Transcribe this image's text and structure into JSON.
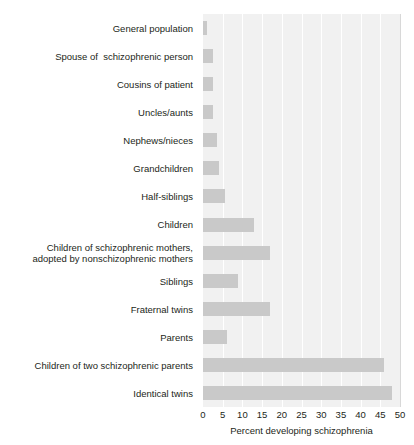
{
  "chart_data": {
    "type": "bar",
    "orientation": "horizontal",
    "title": "",
    "xlabel": "Percent developing schizophrenia",
    "ylabel": "",
    "xlim": [
      0,
      50
    ],
    "xticks": [
      0,
      5,
      10,
      15,
      20,
      25,
      30,
      35,
      40,
      45,
      50
    ],
    "xtick_labels": [
      "0",
      "5",
      "10",
      "15",
      "20",
      "25",
      "30",
      "35",
      "40",
      "45",
      "50"
    ],
    "grid": true,
    "legend": "none",
    "bar_color": "#c9c9c9",
    "plot_background": "#f1f1f1",
    "categories": [
      "General population",
      "Spouse of  schizophrenic person",
      "Cousins of patient",
      "Uncles/aunts",
      "Nephews/nieces",
      "Grandchildren",
      "Half-siblings",
      "Children",
      "Children of schizophrenic mothers,\nadopted by nonschizophrenic mothers",
      "Siblings",
      "Fraternal twins",
      "Parents",
      "Children of two schizophrenic parents",
      "Identical twins"
    ],
    "values": [
      1,
      2.5,
      2.5,
      2.5,
      3.5,
      4,
      5.5,
      13,
      17,
      9,
      17,
      6,
      46,
      48
    ]
  }
}
